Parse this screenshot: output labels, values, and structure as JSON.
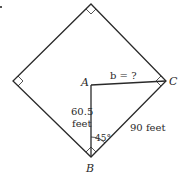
{
  "diagram": {
    "points": {
      "A": {
        "label": "A"
      },
      "B": {
        "label": "B"
      },
      "C": {
        "label": "C"
      }
    },
    "labels": {
      "b_unknown": "b = ?",
      "side_AB_line1": "60.5",
      "side_AB_line2": "feet",
      "side_BC": "90 feet",
      "angle_B": "45°"
    },
    "colors": {
      "stroke": "#2a2a2a",
      "background": "#ffffff"
    }
  }
}
